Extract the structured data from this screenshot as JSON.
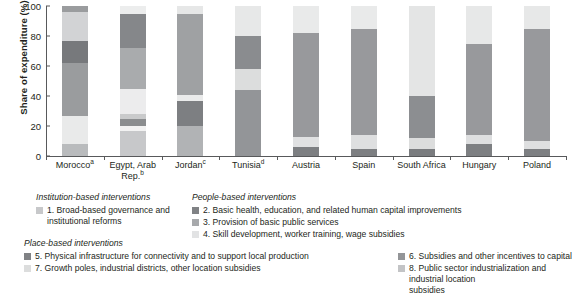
{
  "chart_data": {
    "type": "bar",
    "stacked": true,
    "title": "",
    "xlabel": "",
    "ylabel": "Share of expenditure (%)",
    "ylim": [
      0,
      100
    ],
    "yticks": [
      0,
      20,
      40,
      60,
      80,
      100
    ],
    "grid": false,
    "legend_position": "below",
    "categories": [
      "Morocco",
      "Egypt, Arab Rep.",
      "Jordan",
      "Tunisia",
      "Austria",
      "Spain",
      "South Africa",
      "Hungary",
      "Poland"
    ],
    "category_footnotes": [
      "a",
      "b",
      "c",
      "d",
      "",
      "",
      "",
      "",
      ""
    ],
    "series": [
      {
        "name": "1. Broad-based governance and institutional reforms",
        "key": "s1",
        "color": "#b9bbbd",
        "values": [
          8,
          17,
          0,
          0,
          0,
          0,
          0,
          0,
          0
        ]
      },
      {
        "name": "2. Basic health, education, and related human capital improvements",
        "key": "s2",
        "color": "#7f8083",
        "values": [
          0,
          0,
          0,
          0,
          6,
          5,
          5,
          8,
          5
        ]
      },
      {
        "name": "3. Provision of basic public services",
        "key": "s3",
        "color": "#a5a7a9",
        "values": [
          0,
          4,
          20,
          0,
          0,
          0,
          0,
          0,
          0
        ]
      },
      {
        "name": "4. Skill development, worker training, wage subsidies",
        "key": "s4",
        "color": "#e3e4e5",
        "values": [
          19,
          18,
          4,
          0,
          7,
          9,
          7,
          6,
          5
        ]
      },
      {
        "name": "5. Physical infrastructure for connectivity and to support local production",
        "key": "s5",
        "color": "#6e7073",
        "values": [
          0,
          0,
          18,
          0,
          0,
          0,
          28,
          0,
          0
        ]
      },
      {
        "name": "6. Subsidies and other incentives to capital",
        "key": "s6",
        "color": "#9a9c9e",
        "values": [
          35,
          39,
          36,
          44,
          69,
          71,
          0,
          61,
          75
        ]
      },
      {
        "name": "7. Growth poles, industrial districts, other location subsidies",
        "key": "s7",
        "color": "#d2d3d5",
        "values": [
          19,
          0,
          2,
          14,
          18,
          15,
          60,
          25,
          15
        ]
      },
      {
        "name": "8. Public sector industrialization and industrial location subsidies",
        "key": "s8",
        "color": "#77797c",
        "values": [
          19,
          22,
          20,
          42,
          0,
          0,
          0,
          0,
          0
        ]
      }
    ],
    "stack_order": [
      [
        "s1",
        "s4",
        "s6",
        "s8",
        "s7",
        "s6b"
      ],
      [
        "s1",
        "s4",
        "s3",
        "s6",
        "s8"
      ],
      [
        "s3",
        "s4",
        "s6",
        "s7",
        "s8"
      ],
      [
        "s6",
        "s7",
        "s8",
        "s4"
      ],
      [
        "s2",
        "s4",
        "s6",
        "s7"
      ],
      [
        "s2",
        "s4",
        "s6",
        "s7"
      ],
      [
        "s2",
        "s4",
        "s5",
        "s7"
      ],
      [
        "s2",
        "s4",
        "s6",
        "s7"
      ],
      [
        "s2",
        "s4",
        "s6",
        "s7"
      ]
    ],
    "bars": [
      {
        "category": "Morocco",
        "footnote": "a",
        "segments": [
          {
            "key": "s1",
            "from": 0,
            "to": 8,
            "color": "#b9bbbd"
          },
          {
            "key": "s4",
            "from": 8,
            "to": 27,
            "color": "#e9eaea"
          },
          {
            "key": "s6",
            "from": 27,
            "to": 62,
            "color": "#9a9c9e"
          },
          {
            "key": "s8",
            "from": 62,
            "to": 77,
            "color": "#77797c"
          },
          {
            "key": "s7",
            "from": 77,
            "to": 96,
            "color": "#d2d3d5"
          },
          {
            "key": "s6",
            "from": 96,
            "to": 100,
            "color": "#9a9c9e"
          }
        ]
      },
      {
        "category": "Egypt, Arab Rep.",
        "footnote": "b",
        "segments": [
          {
            "key": "s1",
            "from": 0,
            "to": 17,
            "color": "#c7c8ca"
          },
          {
            "key": "s4",
            "from": 17,
            "to": 20,
            "color": "#f2f2f2"
          },
          {
            "key": "s3",
            "from": 20,
            "to": 25,
            "color": "#8b8d8f"
          },
          {
            "key": "s4",
            "from": 25,
            "to": 28,
            "color": "#c9cacb"
          },
          {
            "key": "s7",
            "from": 28,
            "to": 45,
            "color": "#ececed"
          },
          {
            "key": "s6",
            "from": 45,
            "to": 72,
            "color": "#a9abad"
          },
          {
            "key": "s8",
            "from": 72,
            "to": 95,
            "color": "#85878a"
          },
          {
            "key": "s4",
            "from": 95,
            "to": 100,
            "color": "#eceded"
          }
        ]
      },
      {
        "category": "Jordan",
        "footnote": "c",
        "segments": [
          {
            "key": "s3",
            "from": 0,
            "to": 20,
            "color": "#b1b3b5"
          },
          {
            "key": "s8",
            "from": 20,
            "to": 37,
            "color": "#7d7f82"
          },
          {
            "key": "s4",
            "from": 37,
            "to": 41,
            "color": "#eaebeb"
          },
          {
            "key": "s6",
            "from": 41,
            "to": 95,
            "color": "#9fa1a3"
          },
          {
            "key": "s7",
            "from": 95,
            "to": 100,
            "color": "#e6e7e7"
          }
        ]
      },
      {
        "category": "Tunisia",
        "footnote": "d",
        "segments": [
          {
            "key": "s6",
            "from": 0,
            "to": 44,
            "color": "#939598"
          },
          {
            "key": "s7",
            "from": 44,
            "to": 58,
            "color": "#dcdddd"
          },
          {
            "key": "s8",
            "from": 58,
            "to": 80,
            "color": "#8a8c8f"
          },
          {
            "key": "s4",
            "from": 80,
            "to": 100,
            "color": "#e7e8e8"
          }
        ]
      },
      {
        "category": "Austria",
        "footnote": "",
        "segments": [
          {
            "key": "s2",
            "from": 0,
            "to": 6,
            "color": "#7d7f82"
          },
          {
            "key": "s4",
            "from": 6,
            "to": 13,
            "color": "#e0e1e2"
          },
          {
            "key": "s6",
            "from": 13,
            "to": 82,
            "color": "#98999c"
          },
          {
            "key": "s7",
            "from": 82,
            "to": 100,
            "color": "#e9eaea"
          }
        ]
      },
      {
        "category": "Spain",
        "footnote": "",
        "segments": [
          {
            "key": "s2",
            "from": 0,
            "to": 5,
            "color": "#7d7f82"
          },
          {
            "key": "s4",
            "from": 5,
            "to": 14,
            "color": "#dedfe0"
          },
          {
            "key": "s6",
            "from": 14,
            "to": 85,
            "color": "#98999c"
          },
          {
            "key": "s7",
            "from": 85,
            "to": 100,
            "color": "#e9eaea"
          }
        ]
      },
      {
        "category": "South Africa",
        "footnote": "",
        "segments": [
          {
            "key": "s2",
            "from": 0,
            "to": 5,
            "color": "#7a7c7f"
          },
          {
            "key": "s4",
            "from": 5,
            "to": 12,
            "color": "#dcdddd"
          },
          {
            "key": "s5",
            "from": 12,
            "to": 40,
            "color": "#8c8e91"
          },
          {
            "key": "s7",
            "from": 40,
            "to": 100,
            "color": "#e4e5e5"
          }
        ]
      },
      {
        "category": "Hungary",
        "footnote": "",
        "segments": [
          {
            "key": "s2",
            "from": 0,
            "to": 8,
            "color": "#7d7f82"
          },
          {
            "key": "s4",
            "from": 8,
            "to": 14,
            "color": "#dedfe0"
          },
          {
            "key": "s6",
            "from": 14,
            "to": 75,
            "color": "#98999c"
          },
          {
            "key": "s7",
            "from": 75,
            "to": 100,
            "color": "#e7e8e8"
          }
        ]
      },
      {
        "category": "Poland",
        "footnote": "",
        "segments": [
          {
            "key": "s2",
            "from": 0,
            "to": 5,
            "color": "#7d7f82"
          },
          {
            "key": "s4",
            "from": 5,
            "to": 10,
            "color": "#dedfe0"
          },
          {
            "key": "s6",
            "from": 10,
            "to": 85,
            "color": "#98999c"
          },
          {
            "key": "s7",
            "from": 85,
            "to": 100,
            "color": "#e7e8e8"
          }
        ]
      }
    ]
  },
  "axis": {
    "ylabel": "Share of expenditure (%)",
    "yticks": [
      "100",
      "80",
      "60",
      "40",
      "20",
      "0"
    ]
  },
  "legend": {
    "groups": [
      {
        "heading": "Institution-based interventions",
        "items": [
          {
            "label": "1. Broad-based governance and\n    institutional reforms",
            "color": "#c7c8ca"
          }
        ]
      },
      {
        "heading": "People-based interventions",
        "items": [
          {
            "label": "2. Basic health, education, and related human capital improvements",
            "color": "#808285"
          },
          {
            "label": "3. Provision of basic public services",
            "color": "#a7a9ac"
          },
          {
            "label": "4. Skill development, worker training, wage subsidies",
            "color": "#e2e3e4"
          }
        ]
      },
      {
        "heading": "Place-based interventions",
        "items": [
          {
            "label": "5. Physical infrastructure for connectivity and to support local production",
            "color": "#808285"
          },
          {
            "label": "7. Growth poles, industrial districts, other location subsidies",
            "color": "#dcdddd"
          }
        ]
      },
      {
        "heading": "",
        "items": [
          {
            "label": "6. Subsidies and other incentives to capital",
            "color": "#939598"
          },
          {
            "label": "8. Public sector industrialization and industrial location\n    subsidies",
            "color": "#c3c4c6"
          }
        ]
      }
    ]
  }
}
